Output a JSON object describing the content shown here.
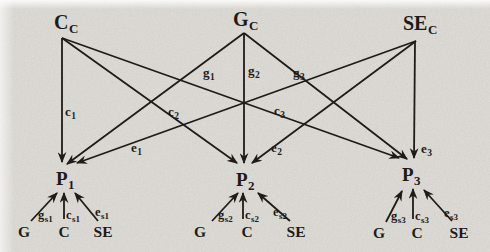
{
  "figure": {
    "background_color": "#e8e6e1",
    "ink_color": "#181512"
  },
  "diagram": {
    "type": "path-diagram",
    "common_factors": [
      {
        "id": "c-common",
        "main": "C",
        "sub": "C",
        "tx": 54,
        "ty": 29,
        "jx": 62,
        "jy": 38
      },
      {
        "id": "g-common",
        "main": "G",
        "sub": "C",
        "tx": 233,
        "ty": 26,
        "jx": 244,
        "jy": 33
      },
      {
        "id": "se-common",
        "main": "SE",
        "sub": "C",
        "tx": 403,
        "ty": 30,
        "jx": 416,
        "jy": 41
      }
    ],
    "phenotypes": [
      {
        "id": "p1",
        "main": "P",
        "sub": "1",
        "tx": 56,
        "ty": 185
      },
      {
        "id": "p2",
        "main": "P",
        "sub": "2",
        "tx": 236,
        "ty": 186
      },
      {
        "id": "p3",
        "main": "P",
        "sub": "3",
        "tx": 402,
        "ty": 181
      }
    ],
    "common_paths": [
      {
        "id": "c1",
        "x1": 62,
        "y1": 38,
        "x2": 62,
        "y2": 162,
        "main": "c",
        "sub": "1",
        "lx": 65,
        "ly": 116
      },
      {
        "id": "c2",
        "x1": 62,
        "y1": 38,
        "x2": 237,
        "y2": 163,
        "main": "c",
        "sub": "2",
        "lx": 168,
        "ly": 116
      },
      {
        "id": "c3",
        "x1": 62,
        "y1": 38,
        "x2": 399,
        "y2": 158,
        "main": "c",
        "sub": "3",
        "lx": 274,
        "ly": 115
      },
      {
        "id": "g1",
        "x1": 244,
        "y1": 33,
        "x2": 67,
        "y2": 164,
        "main": "g",
        "sub": "1",
        "lx": 203,
        "ly": 77
      },
      {
        "id": "g2",
        "x1": 244,
        "y1": 33,
        "x2": 244,
        "y2": 163,
        "main": "g",
        "sub": "2",
        "lx": 248,
        "ly": 75
      },
      {
        "id": "g3",
        "x1": 244,
        "y1": 33,
        "x2": 407,
        "y2": 159,
        "main": "g",
        "sub": "3",
        "lx": 293,
        "ly": 77
      },
      {
        "id": "e1",
        "x1": 416,
        "y1": 41,
        "x2": 77,
        "y2": 163,
        "main": "e",
        "sub": "1",
        "lx": 131,
        "ly": 152
      },
      {
        "id": "e2",
        "x1": 416,
        "y1": 41,
        "x2": 252,
        "y2": 163,
        "main": "e",
        "sub": "2",
        "lx": 271,
        "ly": 152
      },
      {
        "id": "e3",
        "x1": 415,
        "y1": 41,
        "x2": 414,
        "y2": 158,
        "main": "e",
        "sub": "3",
        "lx": 421,
        "ly": 153
      }
    ],
    "specific_groups": [
      {
        "phenotype": "P1",
        "sources": [
          {
            "label": "G",
            "x": 24,
            "y": 237,
            "ax1": 31,
            "ay1": 221,
            "ax2": 57,
            "ay2": 193,
            "main": "g",
            "sub": "s1",
            "lx": 38,
            "ly": 219
          },
          {
            "label": "C",
            "x": 64,
            "y": 237,
            "ax1": 64,
            "ay1": 219,
            "ax2": 64,
            "ay2": 193,
            "main": "c",
            "sub": "s1",
            "lx": 66,
            "ly": 219
          },
          {
            "label": "SE",
            "x": 103,
            "y": 237,
            "ax1": 98,
            "ay1": 221,
            "ax2": 75,
            "ay2": 193,
            "main": "e",
            "sub": "s1",
            "lx": 95,
            "ly": 216
          }
        ]
      },
      {
        "phenotype": "P2",
        "sources": [
          {
            "label": "G",
            "x": 200,
            "y": 237,
            "ax1": 212,
            "ay1": 221,
            "ax2": 238,
            "ay2": 193,
            "main": "g",
            "sub": "s2",
            "lx": 218,
            "ly": 219
          },
          {
            "label": "C",
            "x": 247,
            "y": 237,
            "ax1": 243,
            "ay1": 219,
            "ax2": 243,
            "ay2": 193,
            "main": "c",
            "sub": "s2",
            "lx": 245,
            "ly": 219
          },
          {
            "label": "SE",
            "x": 296,
            "y": 237,
            "ax1": 290,
            "ay1": 221,
            "ax2": 258,
            "ay2": 193,
            "main": "e",
            "sub": "s2",
            "lx": 273,
            "ly": 216
          }
        ]
      },
      {
        "phenotype": "P3",
        "sources": [
          {
            "label": "G",
            "x": 379,
            "y": 238,
            "ax1": 386,
            "ay1": 222,
            "ax2": 402,
            "ay2": 191,
            "main": "g",
            "sub": "s3",
            "lx": 391,
            "ly": 220
          },
          {
            "label": "C",
            "x": 417,
            "y": 238,
            "ax1": 413,
            "ay1": 219,
            "ax2": 413,
            "ay2": 189,
            "main": "c",
            "sub": "s3",
            "lx": 415,
            "ly": 220
          },
          {
            "label": "SE",
            "x": 459,
            "y": 238,
            "ax1": 452,
            "ay1": 221,
            "ax2": 424,
            "ay2": 190,
            "main": "e",
            "sub": "s3",
            "lx": 444,
            "ly": 217
          }
        ]
      }
    ]
  }
}
